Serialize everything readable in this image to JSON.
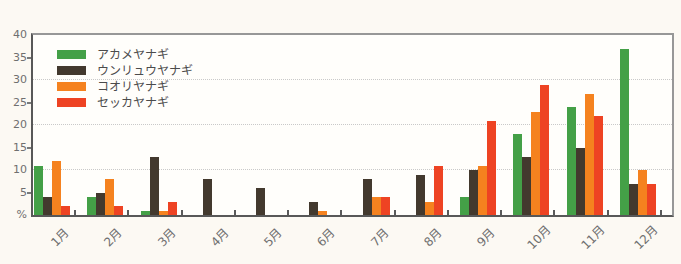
{
  "chart_data": {
    "type": "bar",
    "title": "",
    "unit_label": "%",
    "categories": [
      "1月",
      "2月",
      "3月",
      "4月",
      "5月",
      "6月",
      "7月",
      "8月",
      "9月",
      "10月",
      "11月",
      "12月"
    ],
    "series": [
      {
        "name": "アカメヤナギ",
        "color": "#44a047",
        "values": [
          11,
          4,
          1,
          0,
          0,
          0,
          0,
          0,
          4,
          18,
          24,
          37
        ]
      },
      {
        "name": "ウンリュウヤナギ",
        "color": "#43392e",
        "values": [
          4,
          5,
          13,
          8,
          6,
          3,
          8,
          9,
          10,
          13,
          15,
          7
        ]
      },
      {
        "name": "コオリヤナギ",
        "color": "#f5821f",
        "values": [
          12,
          8,
          1,
          0,
          0,
          1,
          4,
          3,
          11,
          23,
          27,
          10
        ]
      },
      {
        "name": "セッカヤナギ",
        "color": "#ee4323",
        "values": [
          2,
          2,
          3,
          0,
          0,
          0,
          4,
          11,
          21,
          29,
          22,
          7
        ]
      }
    ],
    "xlabel": "",
    "ylabel": "",
    "ylim": [
      0,
      40
    ],
    "ytick_step": 5,
    "ytick_labels": [
      "%",
      "5",
      "10",
      "15",
      "20",
      "25",
      "30",
      "35",
      "40"
    ],
    "gridline_values": [
      10,
      20,
      30
    ],
    "grid": true,
    "legend_position": "top-left"
  },
  "colors": {
    "page_background": "#fcf9f3",
    "plot_background": "#fffefb",
    "axis_dark": "#585858",
    "plot_border": "#979797",
    "grid_line": "#c9c9c9",
    "tick_label_text": "#6f6f6f",
    "legend_text": "#4b4b4b"
  }
}
